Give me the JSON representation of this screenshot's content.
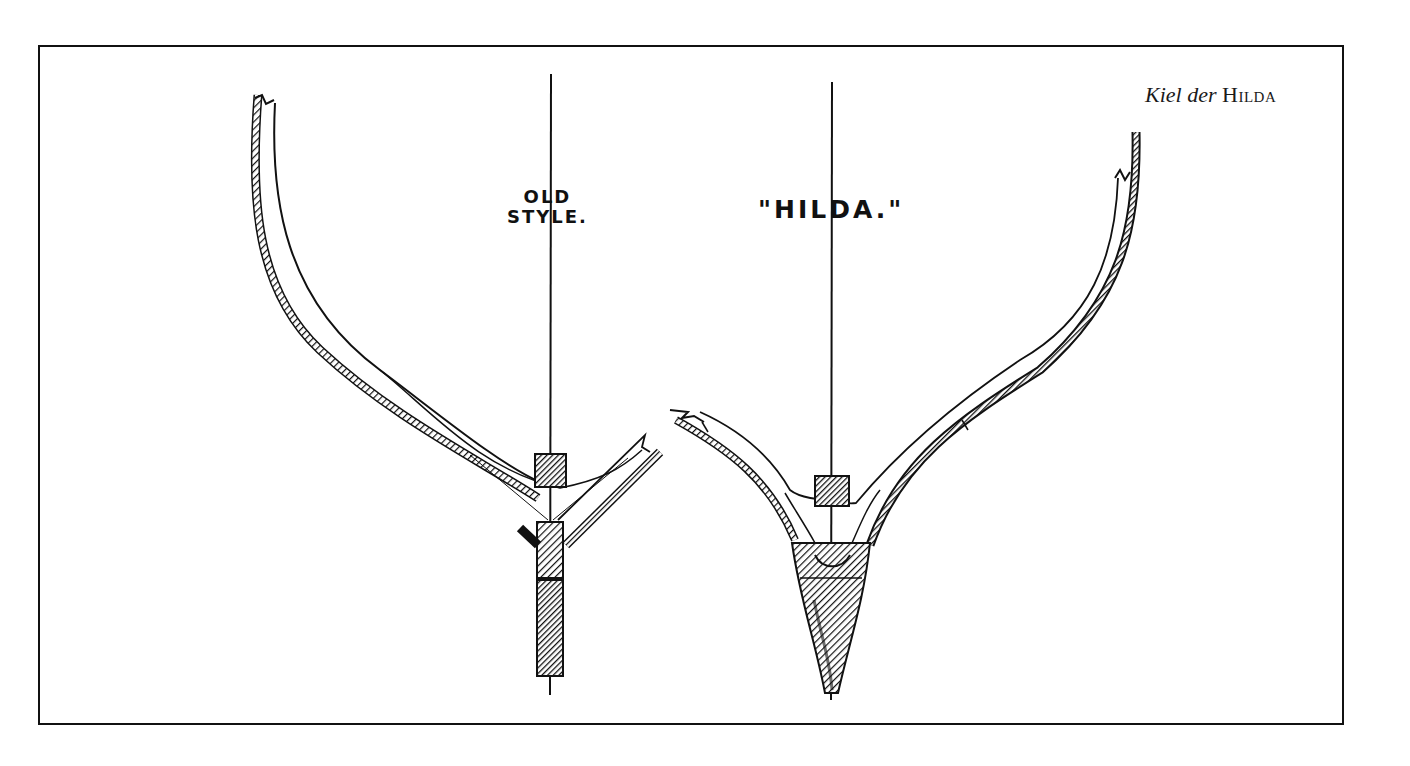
{
  "figure": {
    "caption": {
      "italic_part": "Kiel der",
      "smallcaps_part": "Hilda"
    },
    "drawings": [
      {
        "id": "old-style",
        "label_line1": "OLD",
        "label_line2": "STYLE."
      },
      {
        "id": "hilda",
        "label": "\"HILDA.\""
      }
    ],
    "colors": {
      "ink": "#111111",
      "paper": "#ffffff"
    }
  }
}
